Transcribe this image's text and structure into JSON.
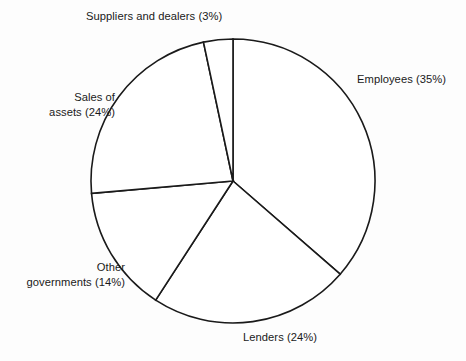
{
  "chart_data": {
    "type": "pie",
    "title": "",
    "subtitle": "",
    "xlabel": "",
    "ylabel": "",
    "legend_position": "none",
    "grid": false,
    "value_unit": "percent",
    "start_angle_deg": 0,
    "direction": "clockwise",
    "categories": [
      "Employees",
      "Lenders",
      "Other governments",
      "Sales of assets",
      "Suppliers and dealers"
    ],
    "values": [
      35,
      24,
      14,
      24,
      3
    ],
    "slices": [
      {
        "name": "Employees",
        "value": 35,
        "label": "Employees (35%)",
        "label_lines": [
          "Employees (35%)"
        ],
        "start_angle_deg": 0,
        "end_angle_deg": 131,
        "label_position": "right"
      },
      {
        "name": "Lenders",
        "value": 24,
        "label": "Lenders (24%)",
        "label_lines": [
          "Lenders (24%)"
        ],
        "start_angle_deg": 131,
        "end_angle_deg": 213,
        "label_position": "bottom"
      },
      {
        "name": "Other governments",
        "value": 14,
        "label": "Other governments (14%)",
        "label_lines": [
          "Other",
          "governments (14%)"
        ],
        "start_angle_deg": 213,
        "end_angle_deg": 265,
        "label_position": "bottom-left"
      },
      {
        "name": "Sales of assets",
        "value": 24,
        "label": "Sales of assets (24%)",
        "label_lines": [
          "Sales of",
          "assets (24%)"
        ],
        "start_angle_deg": 265,
        "end_angle_deg": 348,
        "label_position": "left"
      },
      {
        "name": "Suppliers and dealers",
        "value": 3,
        "label": "Suppliers and dealers (3%)",
        "label_lines": [
          "Suppliers and dealers (3%)"
        ],
        "start_angle_deg": 348,
        "end_angle_deg": 360,
        "label_position": "top"
      }
    ],
    "geometry": {
      "center_x": 233,
      "center_y": 181,
      "radius": 142
    },
    "colors": {
      "background": "#fdfdfd",
      "slice_fill": "#ffffff",
      "stroke": "#1a1a1a",
      "text": "#1a1a1a"
    }
  }
}
